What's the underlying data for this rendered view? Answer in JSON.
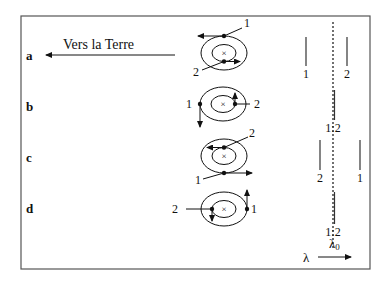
{
  "diagram": {
    "direction_label": "Vers la Terre",
    "rows": [
      {
        "id": "a",
        "label": "a",
        "star1_label": "1",
        "star2_label": "2",
        "spec_left": "1",
        "spec_right": "2"
      },
      {
        "id": "b",
        "label": "b",
        "star1_label": "1",
        "star2_label": "2",
        "spec_center": "1:2"
      },
      {
        "id": "c",
        "label": "c",
        "star1_label": "1",
        "star2_label": "2",
        "spec_left": "2",
        "spec_right": "1"
      },
      {
        "id": "d",
        "label": "d",
        "star1_label": "1",
        "star2_label": "2",
        "spec_center": "1:2"
      }
    ],
    "spec_lambda0": "λ₀",
    "spec_lambda0_main": "λ",
    "spec_lambda0_sub": "0",
    "spec_axis_label": "λ",
    "center_mark": "×",
    "colors": {
      "ink": "#111111",
      "frame": "#555555",
      "background": "#ffffff"
    }
  }
}
